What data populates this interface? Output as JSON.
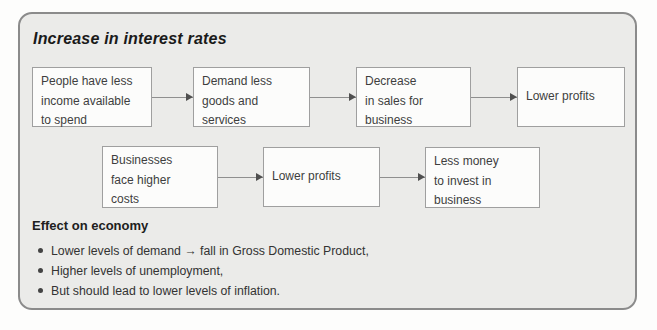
{
  "title": "Increase in interest rates",
  "flow": {
    "row1": [
      {
        "lines": [
          "People have less",
          "income available",
          "to spend"
        ]
      },
      {
        "lines": [
          "Demand less",
          "goods and",
          "services"
        ]
      },
      {
        "lines": [
          "Decrease",
          "in sales for",
          "business"
        ]
      },
      {
        "lines": [
          "Lower profits"
        ]
      }
    ],
    "row2": [
      {
        "lines": [
          "Businesses",
          "face higher",
          "costs"
        ]
      },
      {
        "lines": [
          "Lower profits"
        ]
      },
      {
        "lines": [
          "Less money",
          "to invest in",
          "business"
        ]
      }
    ]
  },
  "effects": {
    "heading": "Effect on economy",
    "items": [
      "Lower levels of demand → fall in Gross Domestic Product,",
      "Higher levels of unemployment,",
      "But should lead to lower levels of inflation."
    ]
  },
  "colors": {
    "panel_background": "#ebebe9",
    "panel_border": "#8b8b8b",
    "box_background": "#fcfcfb",
    "box_border": "#9f9f9f",
    "arrow": "#8f8f8f",
    "text": "#333333"
  }
}
